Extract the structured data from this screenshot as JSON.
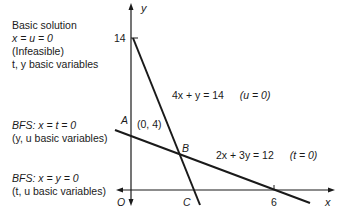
{
  "figure": {
    "annotations": {
      "infeasible_basic": {
        "lines": [
          "Basic solution",
          "x = u = 0",
          "(Infeasible)",
          "t, y basic variables"
        ]
      },
      "bfs_A": {
        "lines": [
          "BFS:  x = t = 0",
          "(y, u basic variables)"
        ]
      },
      "bfs_O": {
        "lines": [
          "BFS:  x = y = 0",
          "(t, u basic variables)"
        ]
      }
    },
    "axes": {
      "x_label": "x",
      "y_label": "y",
      "x_tick": "6",
      "y_tick": "14",
      "origin_label": "O"
    },
    "points": {
      "A": {
        "label": "A",
        "coord_label": "(0, 4)"
      },
      "B": {
        "label": "B"
      },
      "C": {
        "label": "C"
      }
    },
    "constraints": [
      {
        "equation": "4x + y = 14",
        "slack": "(u = 0)"
      },
      {
        "equation": "2x + 3y = 12",
        "slack": "(t = 0)"
      }
    ],
    "colors": {
      "ink": "#1a1a1a",
      "background": "#ffffff"
    }
  }
}
